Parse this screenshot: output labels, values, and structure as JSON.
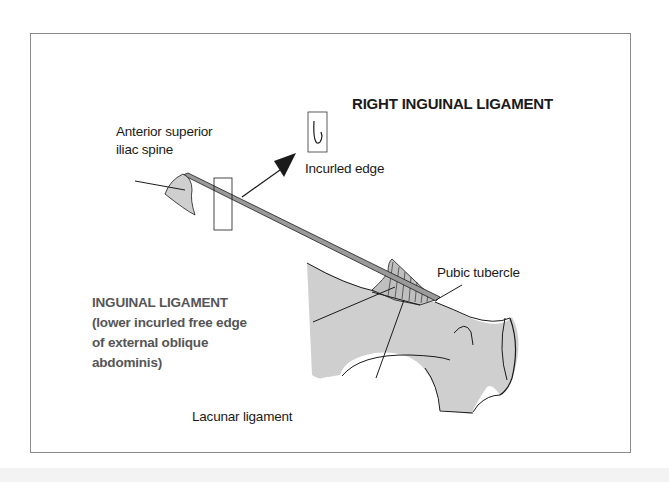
{
  "diagram": {
    "title": "RIGHT INGUINAL LIGAMENT",
    "labels": {
      "asis_line1": "Anterior superior",
      "asis_line2": "iliac spine",
      "incurled_edge": "Incurled edge",
      "inguinal_line1": "INGUINAL LIGAMENT",
      "inguinal_line2": "(lower incurled free edge",
      "inguinal_line3": "of external oblique",
      "inguinal_line4": "abdominis)",
      "pubic_tubercle": "Pubic tubercle",
      "lacunar_ligament": "Lacunar ligament",
      "pubic_crest": "Pubic crest"
    },
    "inset_icon": "incurled-edge-crosssection-icon",
    "colors": {
      "bone_fill": "#cfcfcf",
      "ligament_fill": "#9a9a9a",
      "line": "#1a1a1a",
      "frame": "#8a8a8a",
      "subtitle_text": "#555555"
    }
  }
}
